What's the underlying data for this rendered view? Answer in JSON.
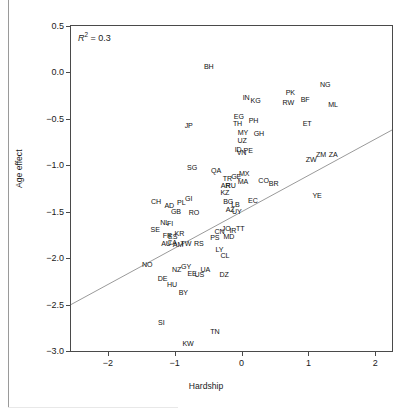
{
  "chart_data": {
    "type": "scatter",
    "title": "",
    "xlabel": "Hardship",
    "ylabel": "Age effect",
    "xlim": [
      -2.55,
      2.25
    ],
    "ylim": [
      -3.0,
      0.5
    ],
    "xticks": [
      -2,
      -1,
      0,
      1,
      2
    ],
    "xticklabels": [
      "−2",
      "−1",
      "0",
      "1",
      "2"
    ],
    "yticks": [
      0.5,
      0.0,
      -0.5,
      -1.0,
      -1.5,
      -2.0,
      -2.5,
      -3.0
    ],
    "yticklabels": [
      "0.5",
      "0.0",
      "−0.5",
      "−1.0",
      "−1.5",
      "−2.0",
      "−2.5",
      "−3.0"
    ],
    "grid": false,
    "legend": null,
    "point_marker": "text-label",
    "annotations": [
      {
        "name": "r-squared",
        "text": "R2 = 0.3",
        "value": 0.3,
        "x": -2.35,
        "y": 0.43
      }
    ],
    "trendline": {
      "type": "linear",
      "x0": -2.55,
      "y0": -2.5,
      "x1": 2.25,
      "y1": -0.62,
      "color": "#9a9a9a"
    },
    "labels": [
      "BH",
      "JP",
      "SG",
      "IN",
      "KG",
      "PK",
      "NG",
      "RW",
      "BF",
      "ML",
      "EG",
      "TH",
      "PH",
      "GH",
      "ET",
      "MY",
      "UZ",
      "ID",
      "VN",
      "PE",
      "ZW",
      "ZM",
      "ZA",
      "QA",
      "TR",
      "GE",
      "MX",
      "MA",
      "CO",
      "BR",
      "YE",
      "AR",
      "RU",
      "KZ",
      "BG",
      "LB",
      "EC",
      "AZ",
      "UY",
      "CH",
      "AD",
      "PL",
      "GI",
      "GB",
      "RO",
      "SE",
      "NL",
      "FI",
      "FR",
      "ES",
      "KR",
      "AU",
      "CA",
      "AM",
      "TW",
      "RS",
      "CN",
      "JO",
      "IR",
      "TT",
      "PS",
      "MD",
      "LY",
      "CL",
      "NO",
      "DE",
      "NZ",
      "GY",
      "EE",
      "US",
      "UA",
      "DZ",
      "HU",
      "BY",
      "SI",
      "KW",
      "TN"
    ],
    "points": [
      {
        "label": "BH",
        "x": -0.49,
        "y": 0.06
      },
      {
        "label": "JP",
        "x": -0.79,
        "y": -0.58
      },
      {
        "label": "SG",
        "x": -0.74,
        "y": -1.03
      },
      {
        "label": "IN",
        "x": 0.07,
        "y": -0.27
      },
      {
        "label": "KG",
        "x": 0.21,
        "y": -0.31
      },
      {
        "label": "PK",
        "x": 0.73,
        "y": -0.22
      },
      {
        "label": "NG",
        "x": 1.25,
        "y": -0.13
      },
      {
        "label": "RW",
        "x": 0.7,
        "y": -0.33
      },
      {
        "label": "BF",
        "x": 0.95,
        "y": -0.3
      },
      {
        "label": "ML",
        "x": 1.37,
        "y": -0.35
      },
      {
        "label": "EG",
        "x": -0.04,
        "y": -0.48
      },
      {
        "label": "TH",
        "x": -0.06,
        "y": -0.55
      },
      {
        "label": "PH",
        "x": 0.18,
        "y": -0.52
      },
      {
        "label": "GH",
        "x": 0.26,
        "y": -0.66
      },
      {
        "label": "ET",
        "x": 0.98,
        "y": -0.55
      },
      {
        "label": "MY",
        "x": 0.02,
        "y": -0.65
      },
      {
        "label": "UZ",
        "x": 0.01,
        "y": -0.74
      },
      {
        "label": "ID",
        "x": -0.05,
        "y": -0.83
      },
      {
        "label": "VN",
        "x": 0.0,
        "y": -0.87
      },
      {
        "label": "PE",
        "x": 0.1,
        "y": -0.85
      },
      {
        "label": "ZW",
        "x": 1.04,
        "y": -0.94
      },
      {
        "label": "ZM",
        "x": 1.19,
        "y": -0.89
      },
      {
        "label": "ZA",
        "x": 1.37,
        "y": -0.89
      },
      {
        "label": "QA",
        "x": -0.38,
        "y": -1.06
      },
      {
        "label": "TR",
        "x": -0.21,
        "y": -1.15
      },
      {
        "label": "GE",
        "x": -0.08,
        "y": -1.13
      },
      {
        "label": "MX",
        "x": 0.04,
        "y": -1.09
      },
      {
        "label": "MA",
        "x": 0.02,
        "y": -1.18
      },
      {
        "label": "CO",
        "x": 0.33,
        "y": -1.17
      },
      {
        "label": "BR",
        "x": 0.48,
        "y": -1.2
      },
      {
        "label": "YE",
        "x": 1.13,
        "y": -1.33
      },
      {
        "label": "AR",
        "x": -0.24,
        "y": -1.22
      },
      {
        "label": "RU",
        "x": -0.16,
        "y": -1.22
      },
      {
        "label": "KZ",
        "x": -0.25,
        "y": -1.3
      },
      {
        "label": "BG",
        "x": -0.2,
        "y": -1.39
      },
      {
        "label": "LB",
        "x": -0.09,
        "y": -1.43
      },
      {
        "label": "EC",
        "x": 0.17,
        "y": -1.38
      },
      {
        "label": "AZ",
        "x": -0.17,
        "y": -1.48
      },
      {
        "label": "UY",
        "x": -0.07,
        "y": -1.5
      },
      {
        "label": "CH",
        "x": -1.28,
        "y": -1.39
      },
      {
        "label": "AD",
        "x": -1.08,
        "y": -1.44
      },
      {
        "label": "PL",
        "x": -0.9,
        "y": -1.41
      },
      {
        "label": "GI",
        "x": -0.79,
        "y": -1.36
      },
      {
        "label": "GB",
        "x": -0.98,
        "y": -1.5
      },
      {
        "label": "RO",
        "x": -0.71,
        "y": -1.51
      },
      {
        "label": "SE",
        "x": -1.29,
        "y": -1.7
      },
      {
        "label": "NL",
        "x": -1.15,
        "y": -1.62
      },
      {
        "label": "FI",
        "x": -1.07,
        "y": -1.63
      },
      {
        "label": "FR",
        "x": -1.11,
        "y": -1.76
      },
      {
        "label": "ES",
        "x": -1.03,
        "y": -1.77
      },
      {
        "label": "KR",
        "x": -0.93,
        "y": -1.74
      },
      {
        "label": "AU",
        "x": -1.13,
        "y": -1.85
      },
      {
        "label": "CA",
        "x": -1.04,
        "y": -1.84
      },
      {
        "label": "AM",
        "x": -0.95,
        "y": -1.86
      },
      {
        "label": "TW",
        "x": -0.83,
        "y": -1.85
      },
      {
        "label": "RS",
        "x": -0.64,
        "y": -1.85
      },
      {
        "label": "CN",
        "x": -0.33,
        "y": -1.72
      },
      {
        "label": "JO",
        "x": -0.23,
        "y": -1.69
      },
      {
        "label": "IR",
        "x": -0.13,
        "y": -1.71
      },
      {
        "label": "TT",
        "x": -0.02,
        "y": -1.69
      },
      {
        "label": "PS",
        "x": -0.4,
        "y": -1.78
      },
      {
        "label": "MD",
        "x": -0.19,
        "y": -1.77
      },
      {
        "label": "LY",
        "x": -0.33,
        "y": -1.91
      },
      {
        "label": "CL",
        "x": -0.25,
        "y": -1.98
      },
      {
        "label": "NO",
        "x": -1.41,
        "y": -2.07
      },
      {
        "label": "DE",
        "x": -1.18,
        "y": -2.22
      },
      {
        "label": "NZ",
        "x": -0.97,
        "y": -2.13
      },
      {
        "label": "GY",
        "x": -0.83,
        "y": -2.1
      },
      {
        "label": "EE",
        "x": -0.74,
        "y": -2.17
      },
      {
        "label": "US",
        "x": -0.63,
        "y": -2.18
      },
      {
        "label": "UA",
        "x": -0.54,
        "y": -2.13
      },
      {
        "label": "DZ",
        "x": -0.26,
        "y": -2.18
      },
      {
        "label": "HU",
        "x": -1.04,
        "y": -2.29
      },
      {
        "label": "BY",
        "x": -0.87,
        "y": -2.38
      },
      {
        "label": "SI",
        "x": -1.2,
        "y": -2.7
      },
      {
        "label": "KW",
        "x": -0.8,
        "y": -2.92
      },
      {
        "label": "TN",
        "x": -0.4,
        "y": -2.79
      }
    ]
  },
  "axes": {
    "x_label": "Hardship",
    "y_label": "Age effect",
    "x_tick_labels": [
      "−2",
      "−1",
      "0",
      "1",
      "2"
    ],
    "y_tick_labels": [
      "0.5",
      "0.0",
      "−0.5",
      "−1.0",
      "−1.5",
      "−2.0",
      "−2.5",
      "−3.0"
    ]
  },
  "annotation": {
    "r_symbol": "R",
    "r_exponent": "2",
    "r_equals": " = 0.3"
  }
}
